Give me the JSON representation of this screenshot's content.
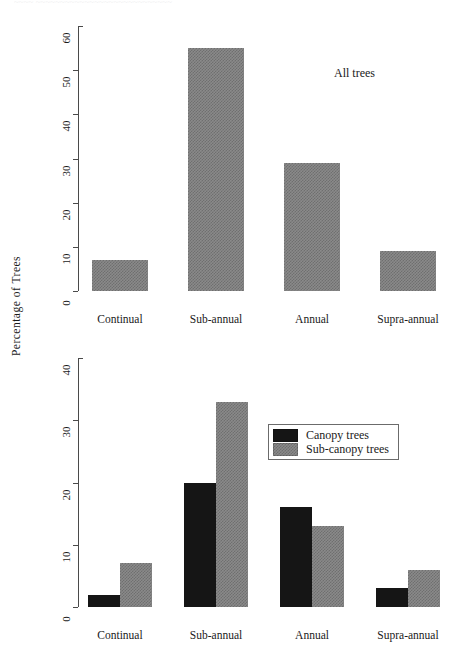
{
  "page": {
    "cutoff_header": "~~~~ ~~~~~~~~~~~~~~~~~~~~~~~~~~~~",
    "y_axis_label": "Percentage  of  Trees"
  },
  "chart_data": [
    {
      "type": "bar",
      "panel": "top",
      "title": "",
      "annotation": "All trees",
      "categories": [
        "Continual",
        "Sub-annual",
        "Annual",
        "Supra-annual"
      ],
      "values": [
        7,
        55,
        29,
        9
      ],
      "series": [
        {
          "name": "All trees",
          "color": "#8a8a8a",
          "values": [
            7,
            55,
            29,
            9
          ]
        }
      ],
      "xlabel": "",
      "ylabel": "Percentage of Trees",
      "ylim": [
        0,
        60
      ],
      "yticks": [
        0,
        10,
        20,
        30,
        40,
        50,
        60
      ],
      "grid": false,
      "legend": false
    },
    {
      "type": "bar",
      "panel": "bottom",
      "title": "",
      "categories": [
        "Continual",
        "Sub-annual",
        "Annual",
        "Supra-annual"
      ],
      "series": [
        {
          "name": "Canopy trees",
          "color": "#151515",
          "values": [
            2,
            20,
            16,
            3
          ]
        },
        {
          "name": "Sub-canopy trees",
          "color": "#8a8a8a",
          "values": [
            7,
            33,
            13,
            6
          ]
        }
      ],
      "xlabel": "",
      "ylabel": "Percentage of Trees",
      "ylim": [
        0,
        40
      ],
      "yticks": [
        0,
        10,
        20,
        30,
        40
      ],
      "grid": false,
      "legend": true,
      "legend_position": "upper-right",
      "legend_entries": [
        {
          "label": "Canopy trees",
          "color": "#151515"
        },
        {
          "label": "Sub-canopy trees",
          "color": "#8a8a8a"
        }
      ]
    }
  ]
}
